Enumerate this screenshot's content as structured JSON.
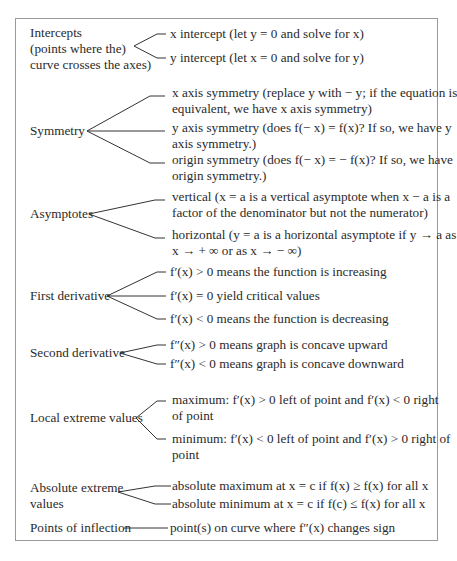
{
  "diagram": {
    "border_color": "#9a9a9a",
    "line_color": "#333333",
    "groups": [
      {
        "label": [
          "Intercepts",
          "(points where the)",
          "curve crosses the axes)"
        ],
        "items": [
          [
            "x intercept (let y = 0 and solve for x)"
          ],
          [
            "y intercept (let x = 0 and solve for y)"
          ]
        ]
      },
      {
        "label": [
          "Symmetry"
        ],
        "items": [
          [
            "x axis symmetry (replace y with − y; if the equation is",
            "equivalent, we have x axis symmetry)"
          ],
          [
            "y axis symmetry (does f(− x) = f(x)? If so, we have y",
            "axis symmetry.)"
          ],
          [
            "origin symmetry (does f(− x) = − f(x)? If so, we have",
            "origin symmetry.)"
          ]
        ]
      },
      {
        "label": [
          "Asymptotes"
        ],
        "items": [
          [
            "vertical (x = a is a vertical asymptote when x − a is a",
            "factor of the denominator but not the numerator)"
          ],
          [
            "horizontal (y = a is a horizontal asymptote if y → a as",
            "x → + ∞ or as x → − ∞)"
          ]
        ]
      },
      {
        "label": [
          "First derivative"
        ],
        "items": [
          [
            "f′(x) > 0 means the function is increasing"
          ],
          [
            "f′(x) = 0 yield critical values"
          ],
          [
            "f′(x) < 0 means the function is decreasing"
          ]
        ]
      },
      {
        "label": [
          "Second derivative"
        ],
        "items": [
          [
            "f″(x) > 0 means graph is concave upward"
          ],
          [
            "f″(x) < 0 means graph is concave downward"
          ]
        ]
      },
      {
        "label": [
          "Local extreme values"
        ],
        "items": [
          [
            "maximum: f′(x) > 0 left of point and f′(x) < 0 right",
            "of point"
          ],
          [
            "minimum: f′(x) < 0 left of point and f′(x) > 0 right of",
            "point"
          ]
        ]
      },
      {
        "label": [
          "Absolute extreme",
          "values"
        ],
        "items": [
          [
            "absolute maximum at x = c if f(x) ≥ f(x) for all x"
          ],
          [
            "absolute minimum at x = c if f(c) ≤ f(x) for all x"
          ]
        ]
      },
      {
        "label": [
          "Points of inflection"
        ],
        "items": [
          [
            "point(s) on curve where f″(x) changes sign"
          ]
        ]
      }
    ]
  }
}
